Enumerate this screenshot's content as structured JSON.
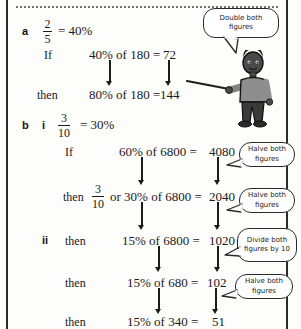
{
  "page": {
    "frame": {
      "left_rule": true,
      "right_rule": true,
      "dotted_rule": true
    },
    "ink_color": "#1a1a1a",
    "bubble_border_color": "#2a2a2a",
    "skin_color": "#4a4a4a",
    "shirt_color": "#8e8e8e",
    "trousers_color": "#3a3a3a"
  },
  "parts": {
    "a": {
      "label": "a",
      "fraction": {
        "numerator": "2",
        "denominator": "5"
      },
      "equals": "= 40%",
      "steps": [
        {
          "word": "If",
          "expression": "40% of 180 =",
          "result": "72"
        },
        {
          "word": "then",
          "expression": "80% of 180 =",
          "result": "144"
        }
      ]
    },
    "b": {
      "label": "b",
      "i": {
        "roman": "i",
        "fraction": {
          "numerator": "3",
          "denominator": "10"
        },
        "equals": "= 30%",
        "steps": [
          {
            "word": "If",
            "expression": "60% of 6800 =",
            "result": "4080"
          },
          {
            "word": "then",
            "fraction": {
              "numerator": "3",
              "denominator": "10"
            },
            "expression_prefix": "or 30% of 6800 =",
            "result": "2040"
          }
        ]
      },
      "ii": {
        "roman": "ii",
        "steps": [
          {
            "word": "then",
            "expression": "15% of 6800 =",
            "result": "1020"
          },
          {
            "word": "then",
            "expression": "15% of 680 =",
            "result": "102"
          },
          {
            "word": "then",
            "expression": "15% of 340 =",
            "result": "51"
          }
        ]
      }
    }
  },
  "bubbles": [
    {
      "id": "bubble-double",
      "text": "Double both figures"
    },
    {
      "id": "bubble-halve-1",
      "text": "Halve both figures"
    },
    {
      "id": "bubble-halve-2",
      "text": "Halve both figures"
    },
    {
      "id": "bubble-divide-10",
      "text": "Divide both figures by 10"
    },
    {
      "id": "bubble-halve-3",
      "text": "Halve both figures"
    }
  ],
  "figure": {
    "name": "teacher-with-pointer"
  }
}
